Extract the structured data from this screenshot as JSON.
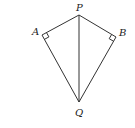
{
  "diagram": {
    "type": "kite",
    "labels": {
      "P": "P",
      "A": "A",
      "B": "B",
      "Q": "Q"
    },
    "points": {
      "P": [
        79,
        15
      ],
      "A": [
        42,
        35
      ],
      "B": [
        116,
        37
      ],
      "Q": [
        79,
        102
      ]
    },
    "segments": [
      "PA",
      "PB",
      "AQ",
      "BQ",
      "PQ"
    ],
    "right_angles": [
      "A",
      "B"
    ],
    "stroke_color": "#333333"
  }
}
